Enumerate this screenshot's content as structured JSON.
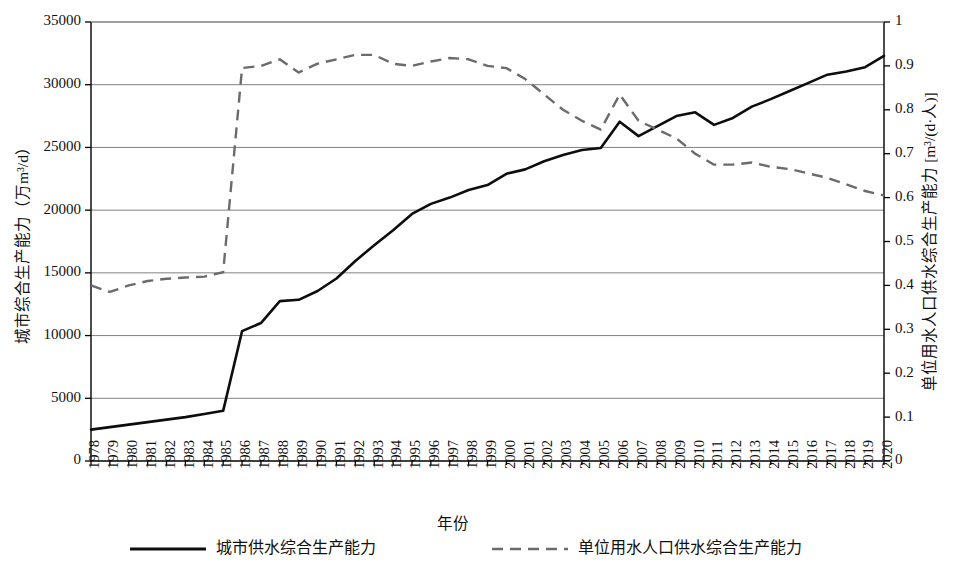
{
  "chart_data": {
    "type": "line",
    "title": "",
    "xlabel": "年份",
    "ylabel": "城市综合生产能力（万m³/d）",
    "y2label": "单位用水人口供水综合生产能力 [m³/(d·人)]",
    "ylim": [
      0,
      35000
    ],
    "y2lim": [
      0,
      1
    ],
    "grid": true,
    "legend_position": "bottom",
    "x": [
      1978,
      1979,
      1980,
      1981,
      1982,
      1983,
      1984,
      1985,
      1986,
      1987,
      1988,
      1989,
      1990,
      1991,
      1992,
      1993,
      1994,
      1995,
      1996,
      1997,
      1998,
      1999,
      2000,
      2001,
      2002,
      2003,
      2004,
      2005,
      2006,
      2007,
      2008,
      2009,
      2010,
      2011,
      2012,
      2013,
      2014,
      2015,
      2016,
      2017,
      2018,
      2019,
      2020
    ],
    "xticklabels": [
      "1978",
      "1979",
      "1980",
      "1981",
      "1982",
      "1983",
      "1984",
      "1985",
      "1986",
      "1987",
      "1988",
      "1989",
      "1990",
      "1991",
      "1992",
      "1993",
      "1994",
      "1995",
      "1996",
      "1997",
      "1998",
      "1999",
      "2000",
      "2001",
      "2002",
      "2003",
      "2004",
      "2005",
      "2006",
      "2007",
      "2008",
      "2009",
      "2010",
      "2011",
      "2012",
      "2013",
      "2014",
      "2015",
      "2016",
      "2017",
      "2018",
      "2019",
      "2020"
    ],
    "yticklabels": [
      "0",
      "5000",
      "10000",
      "15000",
      "20000",
      "25000",
      "30000",
      "35000"
    ],
    "ytickvalues": [
      0,
      5000,
      10000,
      15000,
      20000,
      25000,
      30000,
      35000
    ],
    "y2ticklabels": [
      "0",
      "0.1",
      "0.2",
      "0.3",
      "0.4",
      "0.5",
      "0.6",
      "0.7",
      "0.8",
      "0.9",
      "1"
    ],
    "y2tickvalues": [
      0,
      0.1,
      0.2,
      0.3,
      0.4,
      0.5,
      0.6,
      0.7,
      0.8,
      0.9,
      1
    ],
    "series": [
      {
        "name": "城市供水综合生产能力",
        "axis": "left",
        "style": "solid",
        "color": "#0d0d0d",
        "values": [
          2500,
          2700,
          2900,
          3100,
          3300,
          3500,
          3750,
          4000,
          10350,
          11000,
          12750,
          12850,
          13550,
          14550,
          15950,
          17200,
          18400,
          19700,
          20500,
          21000,
          21600,
          22000,
          22900,
          23250,
          23900,
          24400,
          24800,
          24950,
          27050,
          25900,
          26700,
          27500,
          27800,
          26800,
          27350,
          28250,
          28850,
          29500,
          30150,
          30800,
          31050,
          31400,
          32300
        ]
      },
      {
        "name": "单位用水人口供水综合生产能力",
        "axis": "right",
        "style": "dashed",
        "color": "#6b6b6b",
        "values": [
          0.4,
          0.385,
          0.4,
          0.41,
          0.415,
          0.418,
          0.42,
          0.43,
          0.895,
          0.9,
          0.915,
          0.885,
          0.905,
          0.915,
          0.925,
          0.925,
          0.905,
          0.9,
          0.91,
          0.918,
          0.915,
          0.9,
          0.895,
          0.87,
          0.835,
          0.8,
          0.775,
          0.755,
          0.835,
          0.775,
          0.755,
          0.735,
          0.7,
          0.675,
          0.675,
          0.68,
          0.67,
          0.665,
          0.655,
          0.645,
          0.63,
          0.615,
          0.605
        ]
      }
    ]
  },
  "legend": {
    "entries": [
      {
        "label": "城市供水综合生产能力",
        "style": "solid"
      },
      {
        "label": "单位用水人口供水综合生产能力",
        "style": "dashed"
      }
    ]
  }
}
